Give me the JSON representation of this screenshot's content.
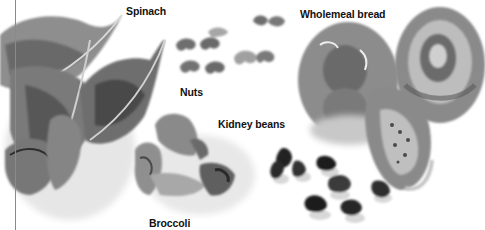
{
  "illustration": {
    "style": "grayscale watercolor",
    "labels": {
      "spinach": "Spinach",
      "nuts": "Nuts",
      "wholemeal_bread": "Wholemeal bread",
      "kidney_beans": "Kidney beans",
      "broccoli": "Broccoli"
    },
    "colors": {
      "background": "#ffffff",
      "label_text": "#111111",
      "edge_line": "#8a8a8a",
      "dark_tone": "#3a3a3a",
      "mid_tone": "#7a7a7a",
      "light_tone": "#b5b5b5",
      "wash_tone": "#dcdcdc"
    }
  }
}
